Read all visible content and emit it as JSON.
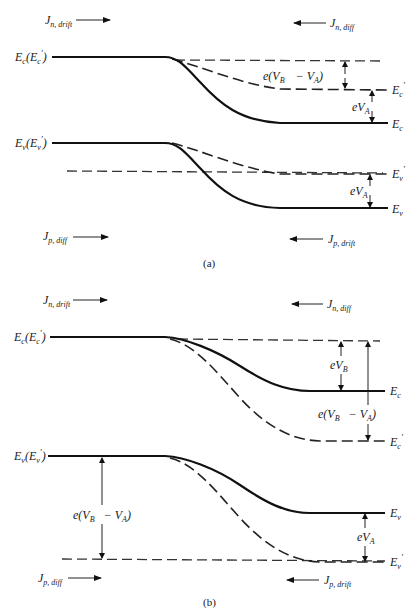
{
  "figure": {
    "panels": [
      {
        "id": "a",
        "caption": "(a)",
        "currents": {
          "n_drift": {
            "symbol": "J",
            "sub": "n, drift",
            "direction": "right"
          },
          "n_diff": {
            "symbol": "J",
            "sub": "n, diff",
            "direction": "left"
          },
          "p_diff": {
            "symbol": "J",
            "sub": "p, diff",
            "direction": "right"
          },
          "p_drift": {
            "symbol": "J",
            "sub": "p, drift",
            "direction": "left"
          }
        },
        "left_labels": {
          "conduction": {
            "main": "E",
            "sub": "c",
            "paren": "(E",
            "psub": "c",
            "prime": "′",
            "close": ")"
          },
          "valence": {
            "main": "E",
            "sub": "v",
            "paren": "(E",
            "psub": "v",
            "prime": "′",
            "close": ")"
          }
        },
        "right_labels": {
          "ec_prime": {
            "main": "E",
            "sub": "c",
            "prime": "′"
          },
          "ec": {
            "main": "E",
            "sub": "c"
          },
          "ev_prime": {
            "main": "E",
            "sub": "v",
            "prime": "′"
          },
          "ev": {
            "main": "E",
            "sub": "v"
          }
        },
        "annotations": {
          "barrier_reduced": {
            "pre": "e(V",
            "sub1": "B",
            "mid": " − V",
            "sub2": "A",
            "post": ")"
          },
          "applied_c": {
            "pre": "eV",
            "sub": "A"
          },
          "applied_v": {
            "pre": "eV",
            "sub": "A"
          }
        }
      },
      {
        "id": "b",
        "caption": "(b)",
        "currents": {
          "n_drift": {
            "symbol": "J",
            "sub": "n, drift",
            "direction": "right"
          },
          "n_diff": {
            "symbol": "J",
            "sub": "n, diff",
            "direction": "left"
          },
          "p_diff": {
            "symbol": "J",
            "sub": "p, diff",
            "direction": "right"
          },
          "p_drift": {
            "symbol": "J",
            "sub": "p, drift",
            "direction": "left"
          }
        },
        "left_labels": {
          "conduction": {
            "main": "E",
            "sub": "c",
            "paren": "(E",
            "psub": "c",
            "prime": "′",
            "close": ")"
          },
          "valence": {
            "main": "E",
            "sub": "v",
            "paren": "(E",
            "psub": "v",
            "prime": "′",
            "close": ")"
          }
        },
        "right_labels": {
          "ec": {
            "main": "E",
            "sub": "c"
          },
          "ec_prime": {
            "main": "E",
            "sub": "c",
            "prime": "′"
          },
          "ev": {
            "main": "E",
            "sub": "v"
          },
          "ev_prime": {
            "main": "E",
            "sub": "v",
            "prime": "′"
          }
        },
        "annotations": {
          "barrier_equilibrium": {
            "pre": "eV",
            "sub": "B"
          },
          "barrier_increased_c": {
            "pre": "e(V",
            "sub1": "B",
            "mid": " − V",
            "sub2": "A",
            "post": ")"
          },
          "barrier_increased_v": {
            "pre": "e(V",
            "sub1": "B",
            "mid": " − V",
            "sub2": "A",
            "post": ")"
          },
          "applied_v": {
            "pre": "eV",
            "sub": "A"
          }
        }
      }
    ]
  }
}
